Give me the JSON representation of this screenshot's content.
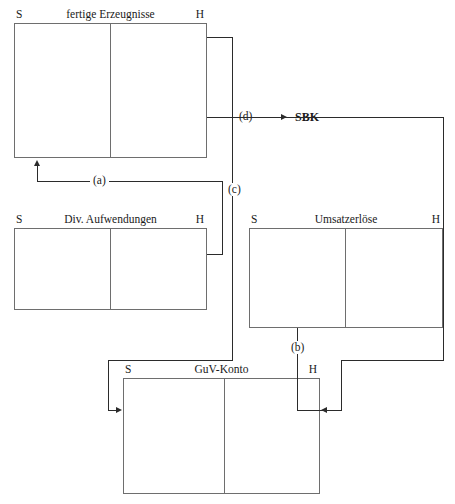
{
  "figure": {
    "kind": "t-account-flow-diagram",
    "side_labels": {
      "debit": "S",
      "credit": "H"
    },
    "colors": {
      "fill_medium_blue": "#9ba8dc",
      "fill_light_blue": "#dce9f7",
      "border_gray": "#6e6e6e",
      "line_black": "#2b2b2b",
      "background": "#ffffff"
    }
  },
  "accounts": {
    "fertige_erzeugnisse": {
      "title": "fertige Erzeugnisse",
      "side_s": "S",
      "side_h": "H",
      "debit_entries": [
        {
          "label": "AB",
          "amount": "500",
          "bold": false,
          "fill": "none"
        },
        {
          "label": "Zugang",
          "amount": "1.000",
          "bold": true,
          "fill": "medium-blue"
        }
      ],
      "credit_entries": [
        {
          "label": "Abgang",
          "amount": "600",
          "bold": true,
          "fill": "light-blue"
        },
        {
          "label": "EB",
          "amount": "900",
          "bold": false,
          "fill": "none"
        }
      ]
    },
    "div_aufwendungen": {
      "title": "Div. Aufwendungen",
      "side_s": "S",
      "side_h": "H",
      "debit_entries": [
        {
          "label": "Aufwand x",
          "label_sub": "p",
          "amount": "1.000",
          "bold": false,
          "fill": "none"
        }
      ],
      "credit_entries": [
        {
          "label": "Saldo",
          "amount": "1.000",
          "bold": true,
          "fill": "medium-blue"
        }
      ]
    },
    "umsatzerloese": {
      "title": "Umsatzerlöse",
      "side_s": "S",
      "side_h": "H",
      "debit_entries": [
        {
          "label": "Saldo",
          "amount": "1.200",
          "bold": false,
          "fill": "none"
        }
      ],
      "credit_entries": [
        {
          "label": "Umsatzerlöse x",
          "label_sub": "a",
          "amount": "1.200",
          "bold": false,
          "fill": "none"
        }
      ]
    },
    "guv_konto": {
      "title": "GuV-Konto",
      "side_s": "S",
      "side_h": "H",
      "debit_entries": [
        {
          "label_line1": "Umsatz-",
          "label_line2": "aufwand x",
          "label_sub": "a",
          "amount": "600",
          "bold": true,
          "fill": "light-blue"
        },
        {
          "label": "Gewinn",
          "amount": "600",
          "bold": false,
          "fill": "none"
        }
      ],
      "credit_entries": [
        {
          "label_line1": "Umsatz-",
          "label_line2": "erlöse x",
          "label_sub": "a",
          "amount": "1.200",
          "bold": false,
          "fill": "none"
        }
      ]
    }
  },
  "flows": [
    {
      "id": "a",
      "label": "(a)"
    },
    {
      "id": "b",
      "label": "(b)"
    },
    {
      "id": "c",
      "label": "(c)"
    },
    {
      "id": "d",
      "label": "(d)"
    }
  ],
  "end_nodes": [
    {
      "id": "sbk",
      "label": "SBK"
    }
  ]
}
